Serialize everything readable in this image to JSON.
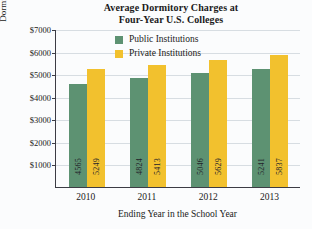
{
  "chart_data": {
    "type": "bar",
    "title": "Average Dormitory Charges at Four-Year U.S. Colleges",
    "title_lines": [
      "Average Dormitory Charges at",
      "Four-Year U.S. Colleges"
    ],
    "xlabel": "Ending Year in the School Year",
    "ylabel": "Dormitory Charges",
    "categories": [
      "2010",
      "2011",
      "2012",
      "2013"
    ],
    "series": [
      {
        "name": "Public Institutions",
        "color": "#5d9272",
        "values": [
          4565,
          4824,
          5046,
          5241
        ]
      },
      {
        "name": "Private Institutions",
        "color": "#f2c12e",
        "values": [
          5249,
          5413,
          5629,
          5837
        ]
      }
    ],
    "ylim": [
      0,
      7000
    ],
    "ytick_labels": [
      "$7000",
      "$6000",
      "$5000",
      "$4000",
      "$3000",
      "$2000",
      "$1000"
    ],
    "ytick_values": [
      7000,
      6000,
      5000,
      4000,
      3000,
      2000,
      1000
    ],
    "grid": true,
    "legend_position": "top-left-inside"
  }
}
